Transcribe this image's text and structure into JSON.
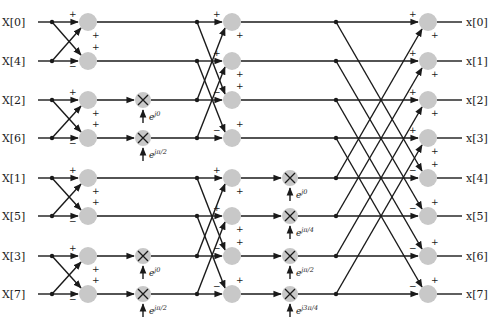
{
  "diagram": {
    "type": "radix-2 decimation-in-time FFT butterfly (8-point)",
    "inputs": [
      "X[0]",
      "X[4]",
      "X[2]",
      "X[6]",
      "X[1]",
      "X[5]",
      "X[3]",
      "X[7]"
    ],
    "outputs": [
      "x[0]",
      "x[1]",
      "x[2]",
      "x[3]",
      "x[4]",
      "x[5]",
      "x[6]",
      "x[7]"
    ],
    "stage1_twiddles": [
      {
        "row": 2,
        "base": "e",
        "exp": "j0"
      },
      {
        "row": 3,
        "base": "e",
        "exp": "jπ/2"
      },
      {
        "row": 6,
        "base": "e",
        "exp": "j0"
      },
      {
        "row": 7,
        "base": "e",
        "exp": "jπ/2"
      }
    ],
    "stage2_twiddles": [
      {
        "row": 4,
        "base": "e",
        "exp": "j0"
      },
      {
        "row": 5,
        "base": "e",
        "exp": "jπ/4"
      },
      {
        "row": 6,
        "base": "e",
        "exp": "jπ/2"
      },
      {
        "row": 7,
        "base": "e",
        "exp": "j3π/4"
      }
    ],
    "signs": {
      "plus": "+",
      "minus": "−"
    },
    "colors": {
      "node": "#c8c8c8",
      "line": "#1a1a1a",
      "background": "#ffffff"
    }
  }
}
